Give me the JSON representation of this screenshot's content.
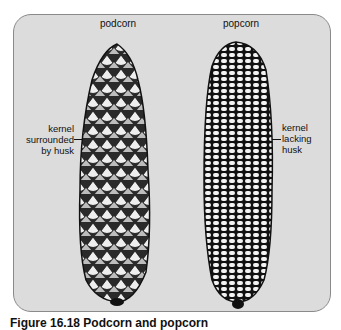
{
  "figure": {
    "panel_background": "#dcdcdc",
    "panel_border": "#8a8a8a",
    "left": {
      "title": "podcorn",
      "label_lines": [
        "kernel",
        "surrounded",
        "by husk"
      ]
    },
    "right": {
      "title": "popcorn",
      "label_lines": [
        "kernel",
        "lacking",
        "husk"
      ]
    },
    "caption": "Figure 16.18 Podcorn and popcorn"
  }
}
